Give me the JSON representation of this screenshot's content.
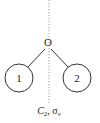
{
  "diagram": {
    "center_atom": {
      "label": "O",
      "x": 48,
      "y": 42
    },
    "nodes": [
      {
        "label": "1",
        "cx": 19,
        "cy": 78,
        "r": 14
      },
      {
        "label": "2",
        "cx": 77,
        "cy": 78,
        "r": 14
      }
    ],
    "bonds": [
      {
        "from": "O",
        "to": "1"
      },
      {
        "from": "O",
        "to": "2"
      }
    ],
    "axis": {
      "style": "dotted",
      "x": 49
    },
    "symmetry_label": {
      "main": "C",
      "subscript": "2",
      "separator": ", ",
      "sigma": "σ",
      "sigma_subscript": "v"
    },
    "colors": {
      "line": "#333333",
      "axis": "#9a9a9a",
      "text": "#222222"
    }
  }
}
